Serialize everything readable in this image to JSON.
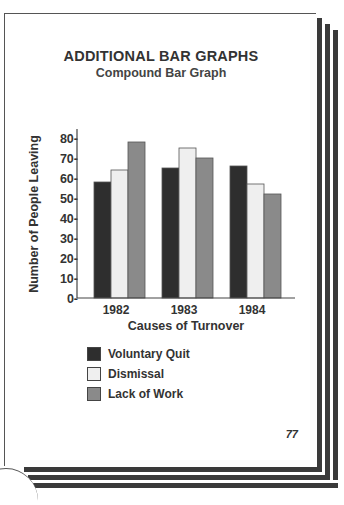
{
  "page": {
    "title": "ADDITIONAL BAR GRAPHS",
    "subtitle": "Compound Bar Graph",
    "page_number": "77"
  },
  "colors": {
    "voluntary_quit": "#2e2e2e",
    "dismissal": "#efefef",
    "lack_of_work": "#8a8a8a",
    "axis": "#444444"
  },
  "chart_data": {
    "type": "bar",
    "title": "Compound Bar Graph",
    "xlabel": "Causes of Turnover",
    "ylabel": "Number of People Leaving",
    "categories": [
      "1982",
      "1983",
      "1984"
    ],
    "series": [
      {
        "name": "Voluntary Quit",
        "values": [
          58,
          65,
          66
        ]
      },
      {
        "name": "Dismissal",
        "values": [
          64,
          75,
          57
        ]
      },
      {
        "name": "Lack of Work",
        "values": [
          78,
          70,
          52
        ]
      }
    ],
    "ylim": [
      0,
      80
    ],
    "yticks": [
      "0-",
      "10-",
      "20-",
      "30-",
      "40-",
      "50-",
      "60-",
      "70-",
      "80-"
    ],
    "grid": false,
    "legend_position": "bottom-left"
  }
}
